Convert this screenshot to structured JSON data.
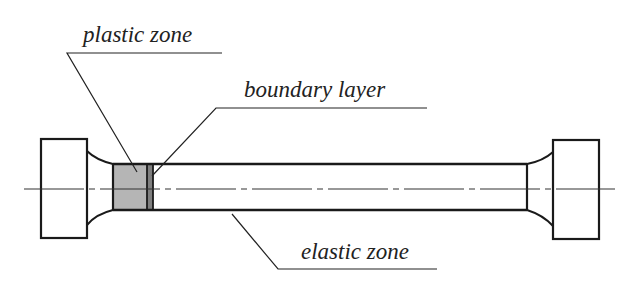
{
  "diagram": {
    "type": "technical-drawing",
    "labels": {
      "plastic_zone": "plastic zone",
      "boundary_layer": "boundary layer",
      "elastic_zone": "elastic zone"
    },
    "colors": {
      "line": "#1a1a1a",
      "plastic_zone_fill": "#b5b5b5",
      "boundary_layer_fill": "#7f7f7f",
      "background": "#ffffff"
    }
  }
}
